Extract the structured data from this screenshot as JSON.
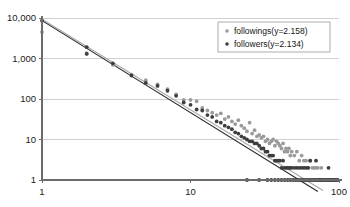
{
  "chart_data": {
    "type": "scatter",
    "title": "",
    "subtitle": "",
    "xlabel": "",
    "ylabel": "",
    "xscale": "log",
    "yscale": "log",
    "xlim": [
      1,
      100
    ],
    "ylim": [
      1,
      10000
    ],
    "grid": true,
    "legend_position": "top-right",
    "x_ticks": [
      {
        "value": 1,
        "label": "1"
      },
      {
        "value": 10,
        "label": "10"
      },
      {
        "value": 100,
        "label": "100"
      }
    ],
    "y_ticks": [
      {
        "value": 1,
        "label": "1"
      },
      {
        "value": 10,
        "label": "10"
      },
      {
        "value": 100,
        "label": "100"
      },
      {
        "value": 1000,
        "label": "1,000"
      },
      {
        "value": 10000,
        "label": "10,000"
      }
    ],
    "series": [
      {
        "name": "followings(y=2.158)",
        "legend_label": "followings(y=2.158)",
        "exponent": 2.158,
        "color": "#9a9a9a",
        "marker": "circle",
        "trendline": {
          "color": "#a8a8a8",
          "x0": 1,
          "y0": 9300,
          "x1": 78,
          "y1": 0.55
        },
        "points": [
          [
            1,
            4500
          ],
          [
            2,
            1350
          ],
          [
            3,
            700
          ],
          [
            4,
            400
          ],
          [
            5,
            290
          ],
          [
            6,
            230
          ],
          [
            7,
            175
          ],
          [
            8,
            130
          ],
          [
            9,
            95
          ],
          [
            10,
            95
          ],
          [
            11,
            88
          ],
          [
            12,
            60
          ],
          [
            13,
            52
          ],
          [
            14,
            46
          ],
          [
            15,
            40
          ],
          [
            16,
            44
          ],
          [
            17,
            32
          ],
          [
            18,
            36
          ],
          [
            19,
            28
          ],
          [
            20,
            24
          ],
          [
            21,
            30
          ],
          [
            22,
            22
          ],
          [
            23,
            19
          ],
          [
            24,
            16
          ],
          [
            25,
            26
          ],
          [
            26,
            14
          ],
          [
            27,
            17
          ],
          [
            28,
            12
          ],
          [
            29,
            13
          ],
          [
            30,
            11
          ],
          [
            31,
            12
          ],
          [
            32,
            9
          ],
          [
            33,
            10
          ],
          [
            34,
            8
          ],
          [
            35,
            9
          ],
          [
            36,
            10
          ],
          [
            37,
            7
          ],
          [
            38,
            9
          ],
          [
            39,
            8
          ],
          [
            40,
            7
          ],
          [
            41,
            6
          ],
          [
            42,
            8
          ],
          [
            43,
            5
          ],
          [
            44,
            6
          ],
          [
            45,
            5
          ],
          [
            46,
            6
          ],
          [
            47,
            4
          ],
          [
            48,
            5
          ],
          [
            50,
            4
          ],
          [
            52,
            5
          ],
          [
            54,
            3
          ],
          [
            56,
            4
          ],
          [
            58,
            3
          ],
          [
            60,
            3
          ],
          [
            62,
            2
          ],
          [
            64,
            3
          ],
          [
            66,
            2
          ],
          [
            68,
            2
          ],
          [
            70,
            2
          ],
          [
            72,
            2
          ],
          [
            74,
            1
          ],
          [
            76,
            2
          ],
          [
            78,
            1
          ],
          [
            80,
            1
          ],
          [
            82,
            1
          ],
          [
            84,
            1
          ],
          [
            86,
            1
          ],
          [
            88,
            1
          ],
          [
            90,
            1
          ],
          [
            92,
            1
          ],
          [
            94,
            1
          ],
          [
            96,
            1
          ]
        ]
      },
      {
        "name": "followers(y=2.134)",
        "legend_label": "followers(y=2.134)",
        "exponent": 2.134,
        "color": "#3d3d3d",
        "marker": "circle",
        "trendline": {
          "color": "#2b2b2b",
          "x0": 1,
          "y0": 8600,
          "x1": 72,
          "y1": 0.52
        },
        "points": [
          [
            1,
            8600
          ],
          [
            2,
            1900
          ],
          [
            2,
            1300
          ],
          [
            3,
            760
          ],
          [
            4,
            380
          ],
          [
            5,
            250
          ],
          [
            6,
            210
          ],
          [
            7,
            160
          ],
          [
            8,
            120
          ],
          [
            9,
            82
          ],
          [
            10,
            72
          ],
          [
            11,
            55
          ],
          [
            12,
            52
          ],
          [
            13,
            40
          ],
          [
            14,
            36
          ],
          [
            15,
            28
          ],
          [
            16,
            26
          ],
          [
            17,
            22
          ],
          [
            18,
            20
          ],
          [
            19,
            18
          ],
          [
            20,
            15
          ],
          [
            21,
            14
          ],
          [
            22,
            12
          ],
          [
            23,
            11
          ],
          [
            24,
            10
          ],
          [
            25,
            9
          ],
          [
            26,
            9
          ],
          [
            27,
            8
          ],
          [
            28,
            8
          ],
          [
            29,
            7
          ],
          [
            30,
            6
          ],
          [
            31,
            6
          ],
          [
            32,
            5
          ],
          [
            33,
            5
          ],
          [
            34,
            4
          ],
          [
            35,
            4
          ],
          [
            36,
            4
          ],
          [
            37,
            3
          ],
          [
            38,
            3
          ],
          [
            39,
            3
          ],
          [
            40,
            3
          ],
          [
            41,
            2
          ],
          [
            42,
            3
          ],
          [
            43,
            2
          ],
          [
            44,
            2
          ],
          [
            45,
            2
          ],
          [
            46,
            2
          ],
          [
            47,
            2
          ],
          [
            48,
            2
          ],
          [
            50,
            2
          ],
          [
            52,
            2
          ],
          [
            54,
            2
          ],
          [
            56,
            2
          ],
          [
            58,
            2
          ],
          [
            60,
            2
          ],
          [
            62,
            2
          ],
          [
            64,
            3
          ],
          [
            70,
            3
          ],
          [
            85,
            2
          ],
          [
            24,
            1
          ],
          [
            29,
            1
          ],
          [
            33,
            1
          ],
          [
            35,
            1
          ],
          [
            37,
            1
          ],
          [
            39,
            1
          ],
          [
            41,
            1
          ],
          [
            43,
            1
          ],
          [
            45,
            1
          ],
          [
            47,
            1
          ],
          [
            49,
            1
          ],
          [
            51,
            1
          ],
          [
            53,
            1
          ],
          [
            55,
            1
          ],
          [
            57,
            1
          ],
          [
            59,
            1
          ],
          [
            61,
            1
          ],
          [
            63,
            1
          ],
          [
            65,
            1
          ],
          [
            67,
            1
          ],
          [
            69,
            1
          ],
          [
            71,
            1
          ],
          [
            73,
            1
          ],
          [
            75,
            1
          ],
          [
            77,
            1
          ],
          [
            80,
            1
          ],
          [
            83,
            1
          ],
          [
            86,
            1
          ],
          [
            89,
            1
          ],
          [
            92,
            1
          ],
          [
            95,
            1
          ],
          [
            98,
            1
          ]
        ]
      }
    ]
  }
}
